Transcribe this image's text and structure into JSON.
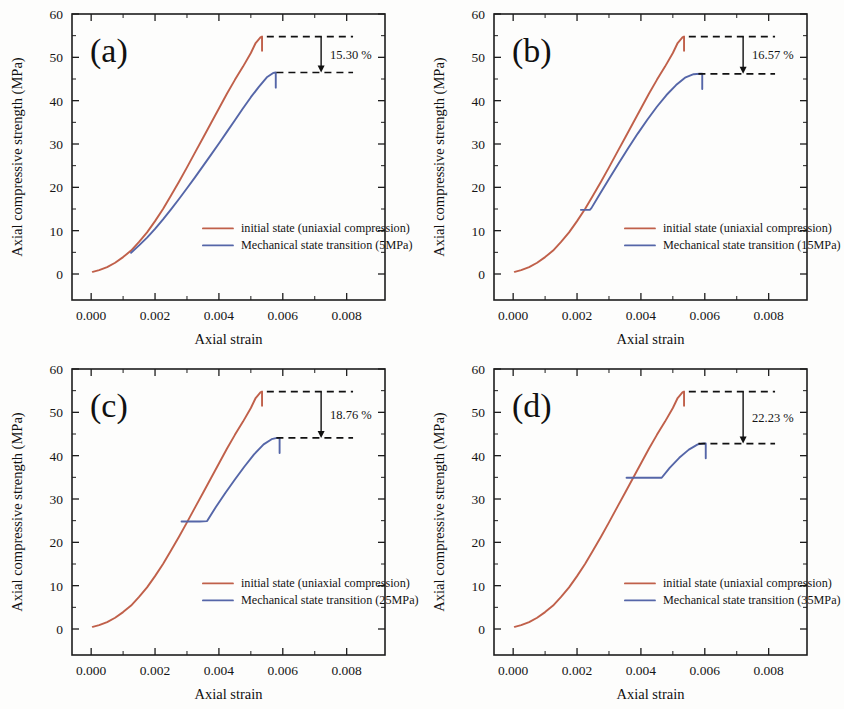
{
  "figure": {
    "background": "#fdfdfc",
    "colors": {
      "initial_state": "#c0604a",
      "transition": "#5566a8",
      "axis": "#1d1d1d",
      "annotation": "#111111"
    }
  },
  "axes": {
    "xlabel": "Axial strain",
    "ylabel": "Axial compressive strength (MPa)",
    "xticks": [
      "0.000",
      "0.002",
      "0.004",
      "0.006",
      "0.008"
    ],
    "xtick_values": [
      0.0,
      0.002,
      0.004,
      0.006,
      0.008
    ],
    "yticks": [
      "0",
      "10",
      "20",
      "30",
      "40",
      "50",
      "60"
    ],
    "ytick_values": [
      0,
      10,
      20,
      30,
      40,
      50,
      60
    ],
    "xlim": [
      -0.0006,
      0.0092
    ],
    "ylim": [
      -6,
      60
    ],
    "grid": false,
    "minor_ticks": true
  },
  "legend": {
    "position": "lower-right-inside",
    "entries": [
      {
        "label": "initial state (uniaxial compression)",
        "color": "#c0604a"
      },
      {
        "label": "Mechanical state transition (5MPa)",
        "color": "#5566a8"
      }
    ]
  },
  "chart_data": [
    {
      "type": "line",
      "panel": "(a)",
      "title": "",
      "xlabel": "Axial strain",
      "ylabel": "Axial compressive strength (MPa)",
      "xlim": [
        -0.0006,
        0.0092
      ],
      "ylim": [
        -6,
        60
      ],
      "grid": false,
      "annotation": "15.30 %",
      "confining_pressure_MPa": 5,
      "peak_initial": 54.8,
      "peak_transition": 46.5,
      "legend": [
        "initial state (uniaxial compression)",
        "Mechanical state transition (5MPa)"
      ],
      "series": [
        {
          "name": "initial state (uniaxial compression)",
          "color": "#c0604a",
          "x": [
            5e-05,
            0.00025,
            0.0005,
            0.00075,
            0.001,
            0.00125,
            0.0015,
            0.00175,
            0.002,
            0.00225,
            0.0025,
            0.00275,
            0.003,
            0.00325,
            0.0035,
            0.00375,
            0.004,
            0.00425,
            0.0045,
            0.00475,
            0.005,
            0.00515,
            0.0053,
            0.00535,
            0.00535
          ],
          "y": [
            0.5,
            0.9,
            1.6,
            2.6,
            3.9,
            5.4,
            7.4,
            9.6,
            12.2,
            15.0,
            18.1,
            21.3,
            24.6,
            28.0,
            31.4,
            34.8,
            38.2,
            41.6,
            44.8,
            47.8,
            51.0,
            53.3,
            54.6,
            54.8,
            51.5
          ]
        },
        {
          "name": "Mechanical state transition (5MPa)",
          "color": "#5566a8",
          "x": [
            0.00125,
            0.0015,
            0.00175,
            0.002,
            0.00225,
            0.0025,
            0.00275,
            0.003,
            0.00325,
            0.0035,
            0.00375,
            0.004,
            0.00425,
            0.0045,
            0.00475,
            0.005,
            0.00525,
            0.0055,
            0.0057,
            0.00578,
            0.00578
          ],
          "y": [
            4.9,
            6.6,
            8.4,
            10.4,
            12.6,
            14.9,
            17.3,
            19.8,
            22.3,
            24.9,
            27.5,
            30.1,
            32.8,
            35.5,
            38.2,
            40.8,
            43.2,
            45.4,
            46.4,
            46.5,
            43.0
          ]
        }
      ]
    },
    {
      "type": "line",
      "panel": "(b)",
      "title": "",
      "xlabel": "Axial strain",
      "ylabel": "Axial compressive strength (MPa)",
      "xlim": [
        -0.0006,
        0.0092
      ],
      "ylim": [
        -6,
        60
      ],
      "grid": false,
      "annotation": "16.57 %",
      "confining_pressure_MPa": 15,
      "peak_initial": 54.8,
      "peak_transition": 46.2,
      "legend": [
        "initial state (uniaxial compression)",
        "Mechanical state transition (15MPa)"
      ],
      "series": [
        {
          "name": "initial state (uniaxial compression)",
          "color": "#c0604a",
          "x": [
            5e-05,
            0.00025,
            0.0005,
            0.00075,
            0.001,
            0.00125,
            0.0015,
            0.00175,
            0.002,
            0.00225,
            0.0025,
            0.00275,
            0.003,
            0.00325,
            0.0035,
            0.00375,
            0.004,
            0.00425,
            0.0045,
            0.00475,
            0.005,
            0.00515,
            0.0053,
            0.00535,
            0.00535
          ],
          "y": [
            0.5,
            0.9,
            1.6,
            2.6,
            3.9,
            5.4,
            7.4,
            9.6,
            12.2,
            15.0,
            18.1,
            21.3,
            24.6,
            28.0,
            31.4,
            34.8,
            38.2,
            41.6,
            44.8,
            47.8,
            51.0,
            53.3,
            54.6,
            54.8,
            51.5
          ]
        },
        {
          "name": "Mechanical state transition (15MPa)",
          "color": "#5566a8",
          "x": [
            0.00212,
            0.0024,
            0.00245,
            0.0027,
            0.003,
            0.0033,
            0.0036,
            0.0039,
            0.0042,
            0.0045,
            0.0048,
            0.0051,
            0.0054,
            0.00565,
            0.00585,
            0.00592,
            0.00592
          ],
          "y": [
            14.8,
            14.8,
            15.2,
            18.3,
            21.9,
            25.5,
            29.0,
            32.4,
            35.6,
            38.6,
            41.3,
            43.6,
            45.4,
            46.1,
            46.2,
            46.2,
            42.7
          ]
        }
      ]
    },
    {
      "type": "line",
      "panel": "(c)",
      "title": "",
      "xlabel": "Axial strain",
      "ylabel": "Axial compressive strength (MPa)",
      "xlim": [
        -0.0006,
        0.0092
      ],
      "ylim": [
        -6,
        60
      ],
      "grid": false,
      "annotation": "18.76 %",
      "confining_pressure_MPa": 25,
      "peak_initial": 54.8,
      "peak_transition": 44.1,
      "legend": [
        "initial state (uniaxial compression)",
        "Mechanical state transition (25MPa)"
      ],
      "series": [
        {
          "name": "initial state (uniaxial compression)",
          "color": "#c0604a",
          "x": [
            5e-05,
            0.00025,
            0.0005,
            0.00075,
            0.001,
            0.00125,
            0.0015,
            0.00175,
            0.002,
            0.00225,
            0.0025,
            0.00275,
            0.003,
            0.00325,
            0.0035,
            0.00375,
            0.004,
            0.00425,
            0.0045,
            0.00475,
            0.005,
            0.00515,
            0.0053,
            0.00535,
            0.00535
          ],
          "y": [
            0.5,
            0.9,
            1.6,
            2.6,
            3.9,
            5.4,
            7.4,
            9.6,
            12.2,
            15.0,
            18.1,
            21.3,
            24.6,
            28.0,
            31.4,
            34.8,
            38.2,
            41.6,
            44.8,
            47.8,
            51.0,
            53.3,
            54.6,
            54.8,
            51.5
          ]
        },
        {
          "name": "Mechanical state transition (25MPa)",
          "color": "#5566a8",
          "x": [
            0.00283,
            0.0031,
            0.0034,
            0.00363,
            0.0039,
            0.0042,
            0.0045,
            0.0048,
            0.0051,
            0.0054,
            0.00565,
            0.00582,
            0.0059,
            0.0059
          ],
          "y": [
            24.8,
            24.8,
            24.8,
            24.9,
            28.1,
            31.4,
            34.5,
            37.5,
            40.3,
            42.6,
            43.8,
            44.1,
            44.1,
            40.6
          ]
        }
      ]
    },
    {
      "type": "line",
      "panel": "(d)",
      "title": "",
      "xlabel": "Axial strain",
      "ylabel": "Axial compressive strength (MPa)",
      "xlim": [
        -0.0006,
        0.0092
      ],
      "ylim": [
        -6,
        60
      ],
      "grid": false,
      "annotation": "22.23 %",
      "confining_pressure_MPa": 35,
      "peak_initial": 54.8,
      "peak_transition": 42.8,
      "legend": [
        "initial state (uniaxial compression)",
        "Mechanical state transition (35MPa)"
      ],
      "series": [
        {
          "name": "initial state (uniaxial compression)",
          "color": "#c0604a",
          "x": [
            5e-05,
            0.00025,
            0.0005,
            0.00075,
            0.001,
            0.00125,
            0.0015,
            0.00175,
            0.002,
            0.00225,
            0.0025,
            0.00275,
            0.003,
            0.00325,
            0.0035,
            0.00375,
            0.004,
            0.00425,
            0.0045,
            0.00475,
            0.005,
            0.00515,
            0.0053,
            0.00535,
            0.00535
          ],
          "y": [
            0.5,
            0.9,
            1.6,
            2.6,
            3.9,
            5.4,
            7.4,
            9.6,
            12.2,
            15.0,
            18.1,
            21.3,
            24.6,
            28.0,
            31.4,
            34.8,
            38.2,
            41.6,
            44.8,
            47.8,
            51.0,
            53.3,
            54.6,
            54.8,
            51.5
          ]
        },
        {
          "name": "Mechanical state transition (35MPa)",
          "color": "#5566a8",
          "x": [
            0.00355,
            0.0038,
            0.0041,
            0.0044,
            0.00465,
            0.0049,
            0.0052,
            0.0055,
            0.00578,
            0.00597,
            0.00603,
            0.00603
          ],
          "y": [
            34.9,
            34.9,
            34.9,
            34.9,
            34.9,
            37.2,
            39.5,
            41.4,
            42.6,
            42.8,
            42.8,
            39.4
          ]
        }
      ]
    }
  ],
  "panels": [
    {
      "id": "a",
      "label": "(a)",
      "annotation": "15.30 %",
      "legend_transition": "Mechanical state transition (5MPa)"
    },
    {
      "id": "b",
      "label": "(b)",
      "annotation": "16.57 %",
      "legend_transition": "Mechanical state transition (15MPa)"
    },
    {
      "id": "c",
      "label": "(c)",
      "annotation": "18.76 %",
      "legend_transition": "Mechanical state transition (25MPa)"
    },
    {
      "id": "d",
      "label": "(d)",
      "annotation": "22.23 %",
      "legend_transition": "Mechanical state transition (35MPa)"
    }
  ],
  "legend_initial": "initial state (uniaxial compression)"
}
